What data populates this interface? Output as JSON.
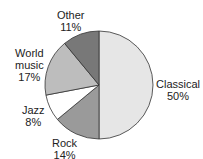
{
  "chart_data": {
    "type": "pie",
    "title": "",
    "categories": [
      "Classical",
      "Rock",
      "Jazz",
      "World music",
      "Other"
    ],
    "values": [
      50,
      14,
      8,
      17,
      11
    ],
    "unit": "%",
    "colors": [
      "#e6e6e6",
      "#9a9a9a",
      "#ffffff",
      "#bdbdbd",
      "#787878"
    ],
    "start_angle_deg": 0,
    "direction": "clockwise-from-top",
    "legend": "none",
    "labels": [
      {
        "name": "Classical",
        "pct": "50%"
      },
      {
        "name": "Rock",
        "pct": "14%"
      },
      {
        "name": "Jazz",
        "pct": "8%"
      },
      {
        "name": "World music",
        "name_lines": [
          "World",
          "music"
        ],
        "pct": "17%"
      },
      {
        "name": "Other",
        "pct": "11%"
      }
    ]
  }
}
